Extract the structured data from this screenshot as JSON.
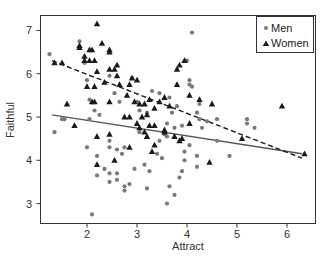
{
  "chart_data": {
    "type": "scatter",
    "title": "",
    "xlabel": "Attract",
    "ylabel": "Faithful",
    "xlim": [
      1.1,
      6.55
    ],
    "ylim": [
      2.6,
      7.4
    ],
    "xticks": [
      2,
      3,
      4,
      5,
      6
    ],
    "yticks": [
      3,
      4,
      5,
      6,
      7
    ],
    "grid": false,
    "legend_position": "top-right",
    "colors": {
      "men": "#7a7a7a",
      "women": "#1a1a1a",
      "frame": "#333333"
    },
    "series": [
      {
        "name": "Men",
        "marker": "circle",
        "points": [
          [
            1.25,
            6.45
          ],
          [
            1.35,
            4.65
          ],
          [
            1.5,
            4.95
          ],
          [
            1.55,
            4.95
          ],
          [
            1.85,
            6.75
          ],
          [
            1.95,
            6.25
          ],
          [
            2.0,
            5.85
          ],
          [
            2.05,
            5.4
          ],
          [
            2.05,
            4.95
          ],
          [
            2.15,
            5.15
          ],
          [
            2.25,
            5.05
          ],
          [
            2.2,
            4.1
          ],
          [
            2.0,
            4.3
          ],
          [
            2.2,
            3.65
          ],
          [
            2.35,
            3.8
          ],
          [
            2.45,
            3.7
          ],
          [
            2.45,
            3.5
          ],
          [
            2.45,
            4.3
          ],
          [
            2.45,
            4.45
          ],
          [
            2.6,
            4.25
          ],
          [
            2.6,
            3.7
          ],
          [
            2.6,
            3.55
          ],
          [
            2.7,
            4.15
          ],
          [
            2.75,
            4.3
          ],
          [
            2.75,
            3.4
          ],
          [
            2.75,
            3.3
          ],
          [
            2.85,
            3.45
          ],
          [
            2.95,
            3.8
          ],
          [
            3.05,
            4.65
          ],
          [
            3.15,
            3.9
          ],
          [
            3.2,
            3.35
          ],
          [
            3.25,
            3.75
          ],
          [
            2.1,
            2.75
          ],
          [
            2.45,
            5.95
          ],
          [
            2.55,
            5.55
          ],
          [
            2.65,
            5.35
          ],
          [
            2.9,
            5.9
          ],
          [
            3.0,
            5.35
          ],
          [
            3.05,
            5.15
          ],
          [
            3.2,
            5.1
          ],
          [
            3.3,
            5.6
          ],
          [
            3.45,
            5.55
          ],
          [
            3.55,
            4.6
          ],
          [
            3.6,
            4.85
          ],
          [
            3.65,
            5.45
          ],
          [
            3.7,
            5.1
          ],
          [
            3.75,
            4.75
          ],
          [
            3.8,
            5.25
          ],
          [
            3.9,
            4.8
          ],
          [
            3.95,
            4.2
          ],
          [
            3.95,
            4.0
          ],
          [
            3.6,
            4.55
          ],
          [
            3.45,
            4.45
          ],
          [
            3.4,
            4.15
          ],
          [
            3.5,
            4.05
          ],
          [
            3.65,
            3.4
          ],
          [
            3.75,
            3.2
          ],
          [
            3.85,
            3.6
          ],
          [
            3.9,
            3.75
          ],
          [
            3.6,
            3.0
          ],
          [
            4.2,
            4.1
          ],
          [
            4.2,
            3.85
          ],
          [
            4.05,
            4.35
          ],
          [
            4.6,
            4.45
          ],
          [
            4.85,
            4.1
          ],
          [
            4.1,
            6.95
          ],
          [
            4.0,
            6.3
          ],
          [
            4.05,
            5.85
          ],
          [
            4.05,
            5.75
          ],
          [
            4.1,
            5.7
          ],
          [
            4.25,
            5.3
          ],
          [
            4.2,
            5.1
          ],
          [
            4.25,
            4.95
          ],
          [
            4.3,
            4.75
          ],
          [
            4.4,
            4.9
          ],
          [
            4.6,
            4.95
          ],
          [
            5.2,
            4.85
          ],
          [
            5.2,
            4.95
          ],
          [
            5.35,
            4.75
          ]
        ]
      },
      {
        "name": "Women",
        "marker": "triangle",
        "points": [
          [
            1.35,
            6.25
          ],
          [
            1.5,
            6.25
          ],
          [
            1.6,
            5.3
          ],
          [
            1.75,
            4.8
          ],
          [
            2.2,
            7.15
          ],
          [
            2.3,
            6.7
          ],
          [
            2.45,
            6.55
          ],
          [
            2.45,
            6.5
          ],
          [
            1.85,
            6.65
          ],
          [
            1.85,
            6.6
          ],
          [
            2.05,
            6.55
          ],
          [
            2.1,
            6.55
          ],
          [
            1.95,
            6.3
          ],
          [
            2.05,
            6.3
          ],
          [
            2.15,
            6.3
          ],
          [
            1.95,
            6.4
          ],
          [
            2.2,
            6.05
          ],
          [
            2.35,
            5.8
          ],
          [
            2.45,
            6.1
          ],
          [
            2.6,
            6.2
          ],
          [
            2.55,
            6.1
          ],
          [
            2.6,
            5.95
          ],
          [
            2.0,
            5.7
          ],
          [
            2.15,
            5.7
          ],
          [
            2.1,
            5.35
          ],
          [
            2.15,
            5.35
          ],
          [
            2.45,
            5.35
          ],
          [
            2.65,
            5.75
          ],
          [
            2.85,
            5.75
          ],
          [
            2.9,
            5.9
          ],
          [
            3.0,
            5.85
          ],
          [
            2.8,
            5.5
          ],
          [
            2.95,
            5.35
          ],
          [
            3.05,
            5.3
          ],
          [
            3.15,
            5.3
          ],
          [
            3.25,
            5.4
          ],
          [
            3.35,
            5.2
          ],
          [
            3.45,
            5.35
          ],
          [
            3.55,
            5.45
          ],
          [
            3.65,
            5.25
          ],
          [
            2.75,
            5.0
          ],
          [
            2.85,
            5.0
          ],
          [
            3.0,
            4.85
          ],
          [
            3.05,
            4.75
          ],
          [
            3.1,
            5.0
          ],
          [
            3.2,
            5.05
          ],
          [
            3.25,
            4.8
          ],
          [
            3.35,
            4.8
          ],
          [
            3.15,
            4.65
          ],
          [
            3.2,
            4.55
          ],
          [
            3.35,
            4.35
          ],
          [
            3.3,
            4.2
          ],
          [
            3.75,
            4.55
          ],
          [
            3.9,
            4.5
          ],
          [
            3.55,
            4.65
          ],
          [
            2.45,
            4.6
          ],
          [
            2.2,
            4.55
          ],
          [
            2.2,
            3.9
          ],
          [
            2.55,
            4.0
          ],
          [
            2.85,
            4.3
          ],
          [
            3.55,
            4.7
          ],
          [
            3.8,
            6.1
          ],
          [
            3.85,
            6.2
          ],
          [
            3.95,
            6.3
          ],
          [
            3.8,
            5.75
          ],
          [
            4.25,
            5.4
          ],
          [
            4.05,
            5.5
          ],
          [
            4.5,
            5.3
          ],
          [
            4.05,
            4.85
          ],
          [
            3.85,
            4.45
          ],
          [
            4.45,
            3.95
          ],
          [
            5.1,
            4.5
          ],
          [
            6.35,
            4.15
          ],
          [
            5.9,
            5.25
          ]
        ]
      }
    ],
    "lines": [
      {
        "name": "Men fit",
        "style": "solid",
        "from": [
          1.3,
          5.05
        ],
        "to": [
          6.3,
          4.15
        ]
      },
      {
        "name": "Women fit",
        "style": "dashed",
        "from": [
          1.3,
          6.3
        ],
        "to": [
          6.3,
          4.05
        ]
      }
    ]
  },
  "legend": {
    "items": [
      {
        "label": "Men"
      },
      {
        "label": "Women"
      }
    ]
  },
  "axes": {
    "xlabel": "Attract",
    "ylabel": "Faithful",
    "xtick_labels": [
      "2",
      "3",
      "4",
      "5",
      "6"
    ],
    "ytick_labels": [
      "3",
      "4",
      "5",
      "6",
      "7"
    ]
  }
}
